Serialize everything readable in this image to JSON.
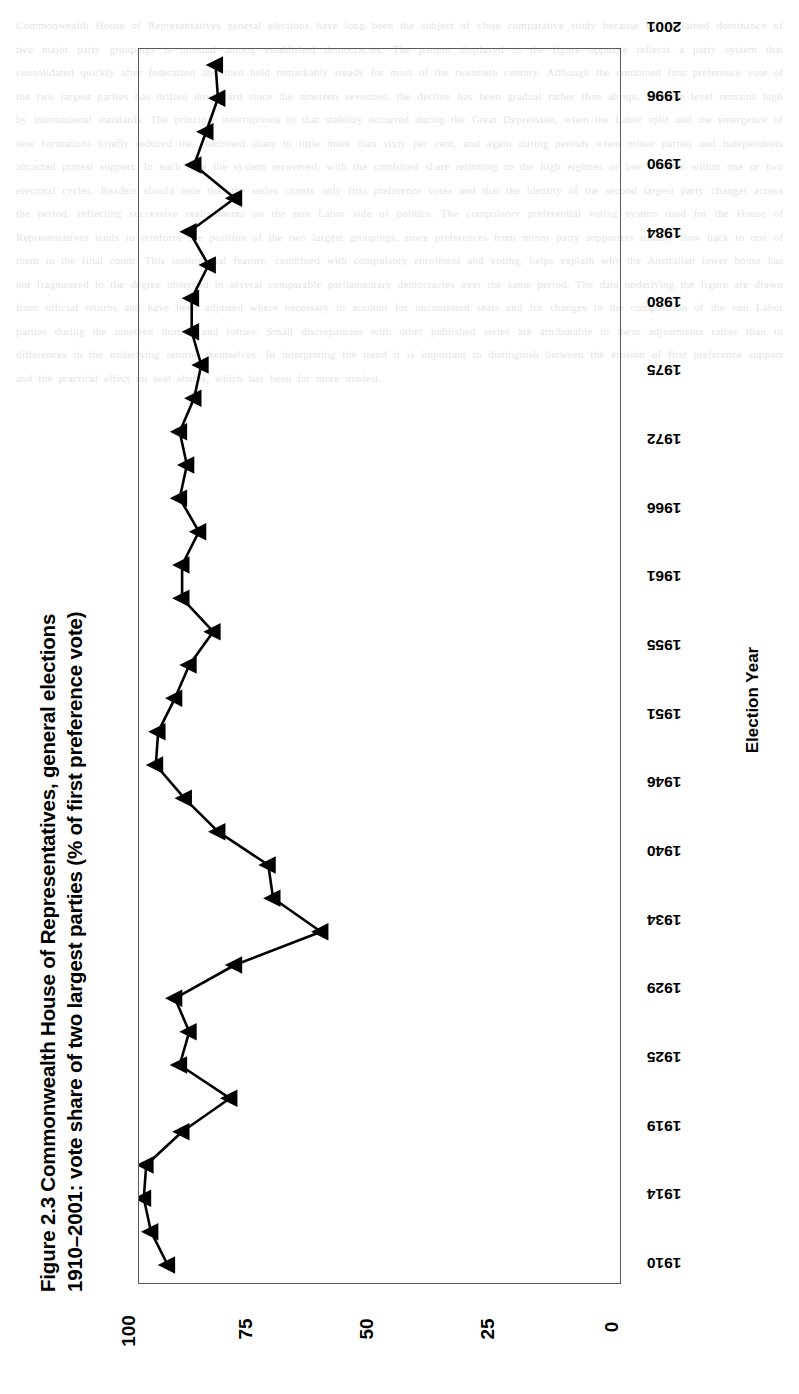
{
  "figure": {
    "title_line1": "Figure 2.3  Commonwealth House of Representatives, general elections",
    "title_line2": "1910–2001: vote share of two largest parties (% of first preference vote)"
  },
  "axis": {
    "x_title": "Election Year",
    "value_ticks": [
      "100",
      "75",
      "50",
      "25",
      "0"
    ],
    "year_ticks": [
      "1910",
      "1914",
      "1919",
      "1925",
      "1929",
      "1934",
      "1940",
      "1946",
      "1951",
      "1955",
      "1961",
      "1966",
      "1972",
      "1975",
      "1980",
      "1984",
      "1990",
      "1996",
      "2001"
    ]
  },
  "legend": {
    "marker": "triangle-marker",
    "label": "Vote share of two largest parties"
  },
  "chart_data": {
    "type": "line",
    "orientation": "rotated-90-clockwise",
    "title": "Figure 2.3  Commonwealth House of Representatives, general elections 1910–2001: vote share of two largest parties (% of first preference vote)",
    "xlabel": "Election Year",
    "ylabel": "",
    "ylim": [
      0,
      100
    ],
    "yticks": [
      0,
      25,
      50,
      75,
      100
    ],
    "grid": false,
    "legend_position": "bottom",
    "series": [
      {
        "name": "Vote share of two largest parties",
        "marker": "triangle",
        "x": [
          "1910",
          "1913",
          "1914",
          "1917",
          "1919",
          "1922",
          "1925",
          "1928",
          "1929",
          "1931",
          "1934",
          "1937",
          "1940",
          "1943",
          "1946",
          "1949",
          "1951",
          "1954",
          "1955",
          "1958",
          "1961",
          "1963",
          "1966",
          "1969",
          "1972",
          "1974",
          "1975",
          "1977",
          "1980",
          "1983",
          "1984",
          "1987",
          "1990",
          "1993",
          "1996",
          "1998",
          "2001"
        ],
        "values": [
          94.0,
          97.5,
          99.0,
          98.5,
          91.0,
          81.0,
          91.5,
          89.5,
          92.5,
          80.0,
          62.0,
          72.0,
          73.0,
          83.5,
          90.5,
          96.5,
          96.0,
          92.5,
          89.5,
          84.5,
          91.0,
          91.0,
          87.5,
          91.5,
          90.0,
          91.5,
          88.5,
          87.0,
          89.0,
          89.0,
          85.5,
          89.5,
          80.0,
          88.5,
          86.0,
          83.5,
          84.0
        ]
      }
    ]
  }
}
